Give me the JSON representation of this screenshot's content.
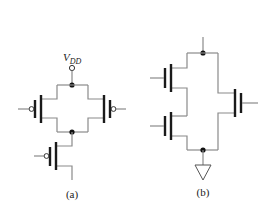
{
  "figure": {
    "type": "transistor-level CMOS schematics",
    "panels": [
      {
        "id": "a",
        "caption": "(a)",
        "supply_label_main": "V",
        "supply_label_sub": "DD",
        "transistors": [
          {
            "name": "left-pmos",
            "type": "PMOS",
            "gate_bubble": true
          },
          {
            "name": "right-pmos",
            "type": "PMOS",
            "gate_bubble": true
          },
          {
            "name": "bottom-pmos",
            "type": "PMOS",
            "gate_bubble": true
          }
        ],
        "topology": "two PMOS in parallel from VDD, in series with one PMOS"
      },
      {
        "id": "b",
        "caption": "(b)",
        "transistors": [
          {
            "name": "left-top-nmos",
            "type": "NMOS",
            "gate_bubble": false
          },
          {
            "name": "left-bottom-nmos",
            "type": "NMOS",
            "gate_bubble": false
          },
          {
            "name": "right-nmos",
            "type": "NMOS",
            "gate_bubble": false
          }
        ],
        "topology": "two NMOS in series, in parallel with one NMOS, to ground"
      }
    ],
    "colors": {
      "wire": "#8a8a8a",
      "plate": "#1a1a1a",
      "node": "#111111",
      "background": "#ffffff"
    }
  }
}
